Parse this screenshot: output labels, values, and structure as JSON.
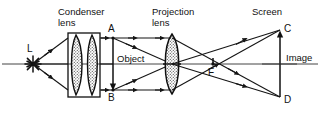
{
  "figure": {
    "background_color": "#ffffff",
    "ink_color": "#111111"
  },
  "labels": {
    "condenser_lens_line1": "Condenser",
    "condenser_lens_line2": "lens",
    "projection_lens_line1": "Projection",
    "projection_lens_line2": "lens",
    "screen": "Screen",
    "object": "Object",
    "image": "Image",
    "source": "L",
    "object_top": "A",
    "object_bottom": "B",
    "image_top": "C",
    "image_bottom": "D",
    "focal_point": "F"
  },
  "components": {
    "light_source": {
      "name": "L",
      "kind": "starburst",
      "x": 33,
      "y": 64
    },
    "condenser_lens": {
      "kind": "two-element-condenser",
      "housing": {
        "x": 68,
        "y": 33,
        "width": 32,
        "height": 64
      },
      "elements": 2
    },
    "object_slide": {
      "kind": "vertical-arrow-down",
      "x": 113,
      "top_y": 38,
      "bottom_y": 90,
      "top_point": "A",
      "bottom_point": "B"
    },
    "projection_lens": {
      "kind": "biconvex",
      "center_x": 172,
      "center_y": 64,
      "half_height": 30,
      "half_width": 8
    },
    "focal_point": {
      "name": "F",
      "x": 213,
      "y": 63
    },
    "screen": {
      "kind": "vertical-line",
      "x": 280,
      "top_y": 30,
      "bottom_y": 97,
      "top_point": "C",
      "bottom_point": "D"
    },
    "optical_axis": {
      "y": 64,
      "from_x": 2,
      "to_x": 318
    }
  }
}
